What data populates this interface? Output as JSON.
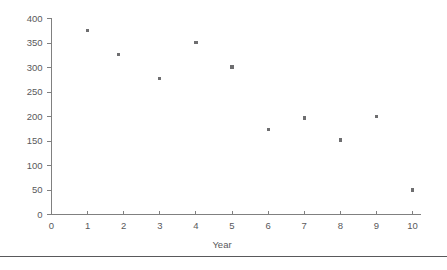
{
  "chart_data": {
    "type": "scatter",
    "title": "",
    "xlabel": "Year",
    "ylabel": "",
    "xlim": [
      0,
      10
    ],
    "ylim": [
      0,
      400
    ],
    "grid": false,
    "legend": false,
    "x_ticks": [
      "0",
      "1",
      "2",
      "3",
      "4",
      "5",
      "6",
      "7",
      "8",
      "9",
      "10"
    ],
    "y_ticks": [
      "0",
      "50",
      "100",
      "150",
      "200",
      "250",
      "300",
      "350",
      "400"
    ],
    "x": [
      1,
      1.85,
      3,
      4,
      5,
      6,
      7,
      8,
      9,
      10
    ],
    "values": [
      375,
      327,
      277,
      351,
      301,
      174,
      197,
      152,
      200,
      50
    ],
    "points": [
      {
        "x": 1,
        "y": 375
      },
      {
        "x": 1.85,
        "y": 327
      },
      {
        "x": 3,
        "y": 277
      },
      {
        "x": 4,
        "y": 351
      },
      {
        "x": 5,
        "y": 301
      },
      {
        "x": 6,
        "y": 174
      },
      {
        "x": 7,
        "y": 197
      },
      {
        "x": 8,
        "y": 152
      },
      {
        "x": 9,
        "y": 200
      },
      {
        "x": 10,
        "y": 50
      }
    ],
    "marker": "square",
    "marker_color": "#6e6e70",
    "axis_color": "#808080",
    "text_color": "#59595b"
  },
  "footer": {
    "rule": ""
  }
}
